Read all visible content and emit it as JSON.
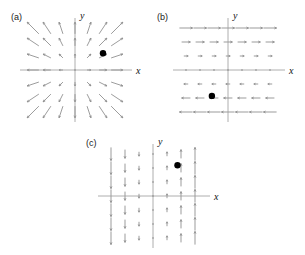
{
  "figure": {
    "type": "vector-field-panels",
    "width": 305,
    "height": 255,
    "background": "#ffffff",
    "arrow_color": "#8a8a8a",
    "axis_color": "#9a9a9a",
    "dot_color": "#000000",
    "label_color": "#1a1a1a"
  },
  "panels": [
    {
      "id": "a",
      "label": "(a)",
      "x_axis_label": "x",
      "y_axis_label": "y",
      "field_description": "radial outward",
      "origin": {
        "x": 75,
        "y": 70
      },
      "grid_step": 14,
      "grid_range": 3,
      "marker": {
        "x": 2,
        "y": 1.2,
        "radius": 3.2
      },
      "axis_x_span": [
        -55,
        57
      ],
      "axis_y_span": [
        -52,
        52
      ]
    },
    {
      "id": "b",
      "label": "(b)",
      "x_axis_label": "x",
      "y_axis_label": "y",
      "field_description": "horizontal, magnitude proportional to y",
      "origin": {
        "x": 228,
        "y": 70
      },
      "grid_step": 14,
      "grid_range": 3,
      "marker": {
        "x": -1.15,
        "y": -1.85,
        "radius": 3.2
      },
      "axis_x_span": [
        -55,
        57
      ],
      "axis_y_span": [
        -52,
        52
      ]
    },
    {
      "id": "c",
      "label": "(c)",
      "x_axis_label": "x",
      "y_axis_label": "y",
      "field_description": "vertical, magnitude proportional to x",
      "origin": {
        "x": 153,
        "y": 196
      },
      "grid_step": 14,
      "grid_range": 3,
      "marker": {
        "x": 1.75,
        "y": 2.2,
        "radius": 3.2
      },
      "axis_x_span": [
        -55,
        57
      ],
      "axis_y_span": [
        -52,
        52
      ]
    }
  ],
  "chart_data": {
    "type": "scatter",
    "title": "",
    "xlabel": "x",
    "ylabel": "y",
    "grid": false,
    "legend": null,
    "panels": [
      {
        "name": "(a)",
        "field": "radial",
        "formula_u": "x",
        "formula_v": "y",
        "marker_point": [
          2,
          1.2
        ],
        "xlim": [
          -3.5,
          3.5
        ],
        "ylim": [
          -3.5,
          3.5
        ]
      },
      {
        "name": "(b)",
        "field": "horizontal-shear",
        "formula_u": "y",
        "formula_v": "0",
        "marker_point": [
          -1.15,
          -1.85
        ],
        "xlim": [
          -3.5,
          3.5
        ],
        "ylim": [
          -3.5,
          3.5
        ]
      },
      {
        "name": "(c)",
        "field": "vertical-shear",
        "formula_u": "0",
        "formula_v": "x",
        "marker_point": [
          1.75,
          2.2
        ],
        "xlim": [
          -3.5,
          3.5
        ],
        "ylim": [
          -3.5,
          3.5
        ]
      }
    ]
  }
}
